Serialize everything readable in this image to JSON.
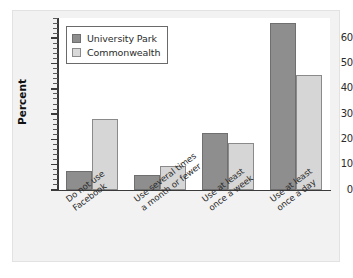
{
  "chart_data": {
    "type": "bar",
    "title": "",
    "xlabel": "",
    "ylabel": "Percent",
    "ylim": [
      0,
      68
    ],
    "yticks": [
      0,
      10,
      20,
      30,
      40,
      50,
      60
    ],
    "ytick_labels": [
      "0",
      "10",
      "20",
      "30",
      "40",
      "50",
      "60"
    ],
    "grid": false,
    "legend_position": "upper left",
    "categories": [
      "Do not use\nFacebook",
      "Use several times\na month or fewer",
      "Use at least\nonce a week",
      "Use at least\nonce a day"
    ],
    "series": [
      {
        "name": "University Park",
        "color": "#8e8e8e",
        "values": [
          7.5,
          6,
          22.5,
          66
        ]
      },
      {
        "name": "Commonwealth",
        "color": "#d6d6d6",
        "values": [
          28,
          9.5,
          18.5,
          45.5
        ]
      }
    ]
  },
  "legend": {
    "entries": [
      {
        "label": "University Park",
        "swatch": "#8e8e8e"
      },
      {
        "label": "Commonwealth",
        "swatch": "#d9d9d9"
      }
    ]
  }
}
